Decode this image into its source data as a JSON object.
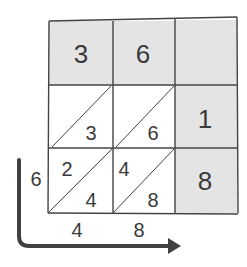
{
  "diagram": {
    "type": "lattice-multiplication",
    "colors": {
      "shade": "#e4e4e4",
      "line": "#444444",
      "text": "#3a3a3a",
      "arrow": "#404040"
    },
    "top_row": [
      "3",
      "6",
      ""
    ],
    "right_column": [
      "",
      "1",
      "8"
    ],
    "lattice_cells": [
      {
        "row": 1,
        "col": 1,
        "tens": "",
        "ones": "3"
      },
      {
        "row": 1,
        "col": 2,
        "tens": "",
        "ones": "6"
      },
      {
        "row": 2,
        "col": 1,
        "tens": "2",
        "ones": "4"
      },
      {
        "row": 2,
        "col": 2,
        "tens": "4",
        "ones": "8"
      }
    ],
    "left_label": "6",
    "bottom_labels": [
      "4",
      "8"
    ]
  }
}
